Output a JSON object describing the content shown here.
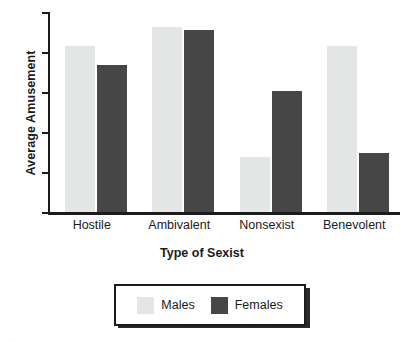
{
  "chart_data": {
    "type": "bar",
    "title": "",
    "xlabel": "Type of Sexist",
    "ylabel": "Average Amusement",
    "categories": [
      "Hostile",
      "Ambivalent",
      "Nonsexist",
      "Benevolent"
    ],
    "series": [
      {
        "name": "Males",
        "color": "#e4e6e6",
        "values": [
          5.15,
          5.62,
          2.38,
          5.15
        ]
      },
      {
        "name": "Females",
        "color": "#464646",
        "values": [
          4.68,
          5.55,
          4.02,
          2.47
        ]
      }
    ],
    "ylim": [
      1,
      6
    ],
    "yticks": [
      1,
      2,
      3,
      4,
      5,
      6
    ],
    "ytick_labels": [
      "1",
      "2",
      "3",
      "4",
      "5",
      "6"
    ],
    "grid": false,
    "legend_position": "bottom-center",
    "legend_entries": [
      "Males",
      "Females"
    ]
  },
  "axis": {
    "line_color": "#1b1b1b"
  },
  "artifact": {
    "text": "...."
  }
}
